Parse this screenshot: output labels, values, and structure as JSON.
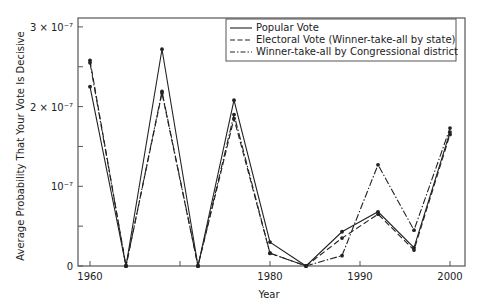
{
  "chart_data": {
    "type": "line",
    "title": "",
    "xlabel": "Year",
    "ylabel": "Average Probability That Your Vote Is Decisive",
    "xlim": [
      1958,
      2002
    ],
    "ylim": [
      0,
      3e-07
    ],
    "x_ticks": [
      {
        "value": 1960,
        "label": "1960"
      },
      {
        "value": 1970,
        "label": ""
      },
      {
        "value": 1980,
        "label": "1980"
      },
      {
        "value": 1990,
        "label": "1990"
      },
      {
        "value": 2000,
        "label": "2000"
      }
    ],
    "y_ticks": [
      {
        "value": 0,
        "label": "0"
      },
      {
        "value": 5e-08,
        "label": ""
      },
      {
        "value": 1e-07,
        "label": "10⁻⁷"
      },
      {
        "value": 1.5e-07,
        "label": ""
      },
      {
        "value": 2e-07,
        "label": "2 × 10⁻⁷"
      },
      {
        "value": 2.5e-07,
        "label": ""
      },
      {
        "value": 3e-07,
        "label": "3 × 10⁻⁷"
      }
    ],
    "grid": false,
    "legend_position": "upper right",
    "x": [
      1960,
      1964,
      1968,
      1972,
      1976,
      1980,
      1984,
      1988,
      1992,
      1996,
      2000
    ],
    "series": [
      {
        "name": "Popular Vote",
        "style": "solid",
        "values": [
          2.25e-07,
          0,
          2.72e-07,
          0,
          2.08e-07,
          3e-08,
          0,
          4.3e-08,
          6.8e-08,
          2.3e-08,
          1.68e-07
        ]
      },
      {
        "name": "Electoral Vote (Winner-take-all by state)",
        "style": "dashed",
        "values": [
          2.58e-07,
          0,
          2.17e-07,
          0,
          1.85e-07,
          1.6e-08,
          0,
          3.5e-08,
          6.5e-08,
          2e-08,
          1.65e-07
        ]
      },
      {
        "name": "Winner-take-all by Congressional district",
        "style": "dashdot",
        "values": [
          2.55e-07,
          0,
          2.19e-07,
          0,
          1.9e-07,
          1.6e-08,
          0,
          1.3e-08,
          1.27e-07,
          4.5e-08,
          1.73e-07
        ]
      }
    ]
  },
  "axes": {
    "xlabel": "Year",
    "ylabel": "Average Probability That Your Vote Is Decisive"
  },
  "legend": {
    "items": [
      {
        "label": "Popular Vote",
        "style": "solid"
      },
      {
        "label": "Electoral Vote (Winner-take-all by state)",
        "style": "dashed"
      },
      {
        "label": "Winner-take-all by Congressional district",
        "style": "dashdot"
      }
    ]
  },
  "colors": {
    "line": "#222222",
    "frame": "#555555"
  }
}
